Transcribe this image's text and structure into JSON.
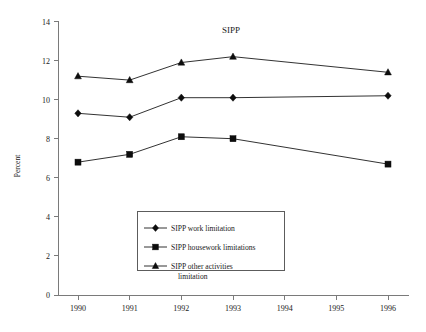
{
  "chart_data": {
    "type": "line",
    "title": "SIPP",
    "xlabel": "",
    "ylabel": "Percent",
    "categories": [
      "1990",
      "1991",
      "1992",
      "1993",
      "1994",
      "1995",
      "1996"
    ],
    "x": [
      1990,
      1991,
      1992,
      1993,
      1994,
      1995,
      1996
    ],
    "ylim": [
      0,
      14
    ],
    "yticks": [
      0,
      2,
      4,
      6,
      8,
      10,
      12,
      14
    ],
    "ytick_labels": [
      "0",
      "2",
      "4",
      "6",
      "8",
      "10",
      "12",
      "14"
    ],
    "grid": false,
    "legend_position": "inside-lower-center",
    "series": [
      {
        "name": "SIPP work limitation",
        "marker": "diamond",
        "color": "#0d0d0d",
        "values": [
          9.3,
          9.1,
          10.1,
          10.1,
          null,
          null,
          10.2
        ]
      },
      {
        "name": "SIPP housework limitations",
        "marker": "square",
        "color": "#0d0d0d",
        "values": [
          6.8,
          7.2,
          8.1,
          8.0,
          null,
          null,
          6.7
        ]
      },
      {
        "name": "SIPP other activities limitation",
        "marker": "triangle",
        "color": "#0d0d0d",
        "values": [
          11.2,
          11.0,
          11.9,
          12.2,
          null,
          null,
          11.4
        ]
      }
    ]
  },
  "legend": {
    "entries": [
      {
        "label": "SIPP work limitation",
        "label_line2": "",
        "marker": "diamond"
      },
      {
        "label": "SIPP housework limitations",
        "label_line2": "",
        "marker": "square"
      },
      {
        "label": "SIPP other activities",
        "label_line2": "limitation",
        "marker": "triangle"
      }
    ]
  }
}
